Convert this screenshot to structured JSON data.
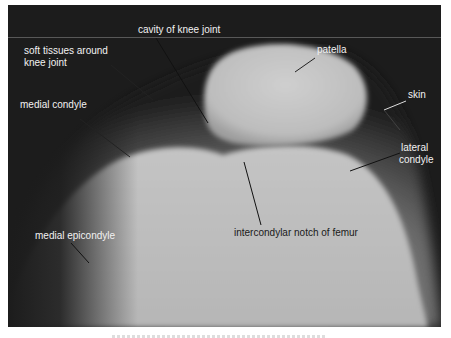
{
  "figure": {
    "type": "radiograph",
    "colors": {
      "background": "#1c1c1c",
      "bone_light": "#c9c9c9",
      "bone_mid": "#a8a8a8",
      "label_light": "#f2f2f2",
      "label_dark": "#1a1a1a"
    },
    "labels": [
      {
        "id": "cavity",
        "text": "cavity of knee joint"
      },
      {
        "id": "soft_tissue_1",
        "text": "soft tissues around"
      },
      {
        "id": "soft_tissue_2",
        "text": "knee joint"
      },
      {
        "id": "patella",
        "text": "patella"
      },
      {
        "id": "skin",
        "text": "skin"
      },
      {
        "id": "medial_condyle",
        "text": "medial condyle"
      },
      {
        "id": "lateral_condyle_1",
        "text": "lateral"
      },
      {
        "id": "lateral_condyle_2",
        "text": "condyle"
      },
      {
        "id": "intercondylar",
        "text": "intercondylar notch of femur"
      },
      {
        "id": "medial_epicondyle",
        "text": "medial epicondyle"
      }
    ]
  },
  "caption": {
    "visible": "partially clipped, illegible"
  }
}
